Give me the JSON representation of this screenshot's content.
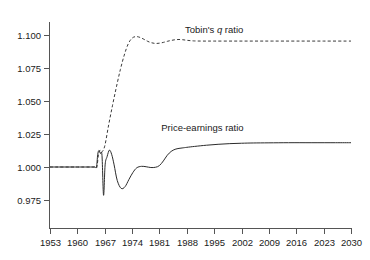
{
  "chart_data": {
    "type": "line",
    "title": "",
    "subtitle": "",
    "xlabel": "",
    "ylabel": "",
    "xlim": [
      1953,
      2030
    ],
    "ylim": [
      0.975,
      1.105
    ],
    "grid": false,
    "legend_position": "inline-annotation",
    "x_ticks": [
      "1953",
      "1960",
      "1967",
      "1974",
      "1981",
      "1988",
      "1995",
      "2002",
      "2009",
      "2016",
      "2023",
      "2030"
    ],
    "y_ticks": [
      "0.975",
      "1.000",
      "1.025",
      "1.050",
      "1.075",
      "1.100"
    ],
    "series": [
      {
        "name": "Tobin's q ratio",
        "label_prefix": "Tobin's ",
        "label_italic": "q",
        "label_suffix": " ratio",
        "style": "dashed",
        "color": "#3a3a3a",
        "x": [
          1953,
          1960,
          1963,
          1964,
          1964.6,
          1965,
          1965.4,
          1965.8,
          1966.2,
          1967,
          1968,
          1969,
          1970,
          1971,
          1972,
          1973,
          1974,
          1975,
          1976,
          1977,
          1978,
          1979,
          1980,
          1981,
          1982,
          1983,
          1984,
          1985,
          1986,
          1987,
          1988,
          1989,
          1990,
          1992,
          1995,
          2000,
          2005,
          2010,
          2016,
          2023,
          2030
        ],
        "y": [
          1.0,
          1.0,
          1.0,
          1.0,
          1.0,
          1.0,
          1.0095,
          1.0128,
          1.0112,
          1.0158,
          1.0318,
          1.0468,
          1.0608,
          1.0738,
          1.0848,
          1.0932,
          1.0976,
          1.0988,
          1.0982,
          1.0968,
          1.0952,
          1.0941,
          1.0936,
          1.0938,
          1.0944,
          1.0952,
          1.0959,
          1.0964,
          1.0966,
          1.0964,
          1.096,
          1.0957,
          1.0955,
          1.0954,
          1.0954,
          1.0954,
          1.0954,
          1.0954,
          1.0954,
          1.0954,
          1.0954
        ]
      },
      {
        "name": "Price-earnings ratio",
        "label_prefix": "Price-earnings ratio",
        "style": "solid",
        "color": "#2b2b2b",
        "x": [
          1953,
          1960,
          1963,
          1964,
          1964.5,
          1964.9,
          1965.2,
          1965.5,
          1965.9,
          1966.3,
          1966.7,
          1967.1,
          1967.6,
          1968.2,
          1968.8,
          1969.4,
          1970.2,
          1971.2,
          1972.2,
          1973.2,
          1974.2,
          1975.2,
          1976.4,
          1977.6,
          1978.8,
          1980,
          1981,
          1982,
          1983,
          1984,
          1985,
          1986,
          1987,
          1988,
          1990,
          1993,
          1996,
          1999,
          2002,
          2005,
          2009,
          2014,
          2020,
          2026,
          2030
        ],
        "y": [
          1.0,
          1.0,
          1.0,
          1.0,
          1.0,
          1.0,
          1.0093,
          1.0125,
          1.0102,
          1.0088,
          0.9786,
          1.0016,
          1.0078,
          1.0128,
          1.0093,
          1.0016,
          0.9898,
          0.9838,
          0.9851,
          0.9906,
          0.9958,
          0.9994,
          1.0005,
          1.0002,
          0.9996,
          0.9998,
          1.0011,
          1.0046,
          1.0089,
          1.0118,
          1.0134,
          1.0141,
          1.0145,
          1.0149,
          1.0156,
          1.0165,
          1.0172,
          1.0177,
          1.018,
          1.0182,
          1.0183,
          1.0184,
          1.0184,
          1.0184,
          1.0184
        ]
      }
    ],
    "annotations": [
      {
        "text": "Tobin's q ratio",
        "x": 1995,
        "y": 1.1015
      },
      {
        "text": "Price-earnings ratio",
        "x": 1992,
        "y": 1.0275
      }
    ]
  },
  "axes": {
    "left_axis_name": "value-axis",
    "bottom_axis_name": "year-axis"
  }
}
